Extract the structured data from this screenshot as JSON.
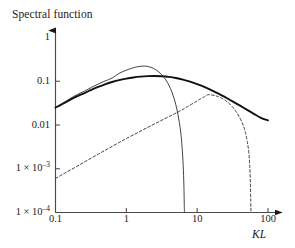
{
  "chart_data": {
    "type": "line",
    "title": "Spectral function",
    "xlabel": "KL",
    "ylabel": "",
    "xscale": "log",
    "yscale": "log",
    "xlim": [
      0.1,
      100
    ],
    "ylim": [
      0.0001,
      1
    ],
    "grid": false,
    "legend": "none",
    "x_ticks": [
      {
        "value": 0.1,
        "label": "0.1"
      },
      {
        "value": 1,
        "label": "1"
      },
      {
        "value": 10,
        "label": "10"
      },
      {
        "value": 100,
        "label": "100"
      }
    ],
    "y_ticks": [
      {
        "value": 1,
        "label": "1",
        "exponent": ""
      },
      {
        "value": 0.1,
        "label": "0.1",
        "exponent": ""
      },
      {
        "value": 0.01,
        "label": "0.01",
        "exponent": ""
      },
      {
        "value": 0.001,
        "label": "1 × 10",
        "exponent": "–3"
      },
      {
        "value": 0.0001,
        "label": "1 × 10",
        "exponent": "–4"
      }
    ],
    "series": [
      {
        "name": "broad-spectrum-thick-solid",
        "style": "solid",
        "linewidth": 1.9,
        "color": "#101010",
        "peak_x": 2.0,
        "peak_y": 0.132,
        "points": [
          [
            0.1,
            0.025
          ],
          [
            0.13,
            0.0312
          ],
          [
            0.16,
            0.0377
          ],
          [
            0.2,
            0.0452
          ],
          [
            0.26,
            0.0543
          ],
          [
            0.32,
            0.0637
          ],
          [
            0.4,
            0.0742
          ],
          [
            0.5,
            0.0852
          ],
          [
            0.63,
            0.0962
          ],
          [
            0.79,
            0.1062
          ],
          [
            1.0,
            0.115
          ],
          [
            1.26,
            0.1222
          ],
          [
            1.58,
            0.1275
          ],
          [
            2.0,
            0.1308
          ],
          [
            2.51,
            0.1318
          ],
          [
            3.16,
            0.13
          ],
          [
            3.98,
            0.1255
          ],
          [
            5.01,
            0.1185
          ],
          [
            6.31,
            0.109
          ],
          [
            7.94,
            0.098
          ],
          [
            10.0,
            0.0862
          ],
          [
            12.6,
            0.0742
          ],
          [
            15.8,
            0.0628
          ],
          [
            20.0,
            0.0522
          ],
          [
            25.1,
            0.0428
          ],
          [
            31.6,
            0.0348
          ],
          [
            39.8,
            0.028
          ],
          [
            50.1,
            0.0224
          ],
          [
            63.1,
            0.018
          ],
          [
            79.4,
            0.0146
          ],
          [
            100.0,
            0.0128
          ]
        ]
      },
      {
        "name": "peaked-spectrum-thin-solid",
        "style": "solid",
        "linewidth": 0.85,
        "color": "#222222",
        "peak_x": 1.6,
        "peak_y": 0.222,
        "cutoff_x": 6.6,
        "points": [
          [
            0.1,
            0.025
          ],
          [
            0.13,
            0.0322
          ],
          [
            0.16,
            0.04
          ],
          [
            0.2,
            0.0492
          ],
          [
            0.26,
            0.06
          ],
          [
            0.32,
            0.0722
          ],
          [
            0.4,
            0.0862
          ],
          [
            0.5,
            0.1015
          ],
          [
            0.63,
            0.1182
          ],
          [
            0.79,
            0.1512
          ],
          [
            1.0,
            0.179
          ],
          [
            1.2,
            0.1985
          ],
          [
            1.4,
            0.2125
          ],
          [
            1.6,
            0.2205
          ],
          [
            1.8,
            0.222
          ],
          [
            2.0,
            0.218
          ],
          [
            2.3,
            0.204
          ],
          [
            2.6,
            0.184
          ],
          [
            3.0,
            0.154
          ],
          [
            3.4,
            0.123
          ],
          [
            3.8,
            0.094
          ],
          [
            4.2,
            0.068
          ],
          [
            4.6,
            0.0462
          ],
          [
            5.0,
            0.029
          ],
          [
            5.4,
            0.0162
          ],
          [
            5.8,
            0.0078
          ],
          [
            6.1,
            0.0034
          ],
          [
            6.35,
            0.0012
          ],
          [
            6.5,
            0.0004
          ],
          [
            6.58,
            0.00014
          ],
          [
            6.62,
            0.0001
          ]
        ]
      },
      {
        "name": "shifted-spectrum-dashed",
        "style": "dashed",
        "linewidth": 0.9,
        "color": "#2a2a2a",
        "peak_x": 14.0,
        "peak_y": 0.05,
        "cutoff_x": 57.0,
        "points": [
          [
            0.1,
            0.0006
          ],
          [
            0.14,
            0.00082
          ],
          [
            0.2,
            0.00113
          ],
          [
            0.28,
            0.00155
          ],
          [
            0.4,
            0.00215
          ],
          [
            0.56,
            0.00292
          ],
          [
            0.79,
            0.00398
          ],
          [
            1.0,
            0.0049
          ],
          [
            1.41,
            0.00655
          ],
          [
            2.0,
            0.0088
          ],
          [
            2.82,
            0.0117
          ],
          [
            4.0,
            0.0156
          ],
          [
            5.62,
            0.0206
          ],
          [
            7.0,
            0.0252
          ],
          [
            8.91,
            0.0318
          ],
          [
            10.0,
            0.0356
          ],
          [
            11.2,
            0.0398
          ],
          [
            12.6,
            0.0442
          ],
          [
            14.1,
            0.049
          ],
          [
            15.8,
            0.0488
          ],
          [
            17.8,
            0.047
          ],
          [
            20.0,
            0.0442
          ],
          [
            22.4,
            0.0406
          ],
          [
            25.1,
            0.0362
          ],
          [
            28.2,
            0.0312
          ],
          [
            31.6,
            0.0258
          ],
          [
            35.5,
            0.0202
          ],
          [
            39.8,
            0.0148
          ],
          [
            44.7,
            0.0098
          ],
          [
            48.0,
            0.0068
          ],
          [
            51.0,
            0.0042
          ],
          [
            53.5,
            0.0024
          ],
          [
            55.2,
            0.0012
          ],
          [
            56.4,
            0.00048
          ],
          [
            57.1,
            0.00018
          ],
          [
            57.5,
            0.0001
          ]
        ]
      }
    ]
  }
}
